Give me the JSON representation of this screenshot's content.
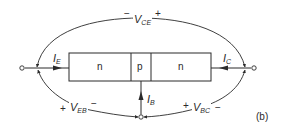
{
  "diagram": {
    "type": "npn-transistor-bias-diagram",
    "panel_label": "(b)",
    "regions": [
      {
        "label": "n"
      },
      {
        "label": "p"
      },
      {
        "label": "n"
      }
    ],
    "currents": {
      "emitter": {
        "symbol": "I",
        "subscript": "E"
      },
      "base": {
        "symbol": "I",
        "subscript": "B"
      },
      "collector": {
        "symbol": "I",
        "subscript": "C"
      }
    },
    "voltages": {
      "vce": {
        "symbol": "V",
        "subscript": "CE",
        "left_sign": "−",
        "right_sign": "+"
      },
      "veb": {
        "symbol": "V",
        "subscript": "EB",
        "left_sign": "+",
        "right_sign": "−"
      },
      "vbc": {
        "symbol": "V",
        "subscript": "BC",
        "left_sign": "+",
        "right_sign": "−"
      }
    },
    "colors": {
      "stroke": "#2a2a2a",
      "background": "#ffffff"
    }
  }
}
